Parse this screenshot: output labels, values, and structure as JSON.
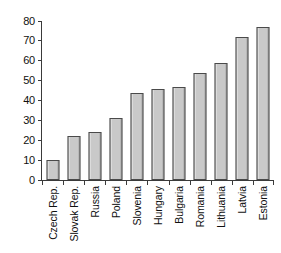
{
  "chart_data": {
    "type": "bar",
    "title": "",
    "subtitle": "",
    "xlabel": "",
    "ylabel": "",
    "categories": [
      "Czech Rep.",
      "Slovak Rep.",
      "Russia",
      "Poland",
      "Slovenia",
      "Hungary",
      "Bulgaria",
      "Romania",
      "Lithuania",
      "Latvia",
      "Estonia"
    ],
    "values": [
      10,
      22,
      24,
      31,
      44,
      46,
      47,
      54,
      59,
      72,
      77
    ],
    "ylim": [
      0,
      80
    ],
    "yticks": [
      0,
      10,
      20,
      30,
      40,
      50,
      60,
      70,
      80
    ],
    "ytick_labels": [
      "0",
      "10",
      "20",
      "30",
      "40",
      "50",
      "60",
      "70",
      "80"
    ],
    "grid": false,
    "legend": false,
    "legend_position": "none",
    "annotations": [],
    "bar_fill_color": "#c9c9c9",
    "bar_edge_color": "#4a4a4a",
    "axis_color": "#3a3a3a",
    "background_color": "#ffffff",
    "text_color": "#101010"
  }
}
